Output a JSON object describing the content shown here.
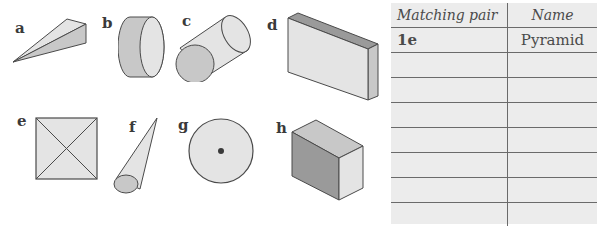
{
  "shapes": [
    {
      "label": "a",
      "depicts": "triangular prism (wedge/pyramid-like)"
    },
    {
      "label": "b",
      "depicts": "cylinder (short disc)"
    },
    {
      "label": "c",
      "depicts": "cylinder (lying)"
    },
    {
      "label": "d",
      "depicts": "cuboid"
    },
    {
      "label": "e",
      "depicts": "square-based pyramid (top view)"
    },
    {
      "label": "f",
      "depicts": "cone"
    },
    {
      "label": "g",
      "depicts": "cone (top view)"
    },
    {
      "label": "h",
      "depicts": "cuboid (cube)"
    }
  ],
  "table": {
    "headers": [
      "Matching pair",
      "Name"
    ],
    "rows": [
      [
        "1e",
        "Pyramid"
      ],
      [
        "",
        ""
      ],
      [
        "",
        ""
      ],
      [
        "",
        ""
      ],
      [
        "",
        ""
      ],
      [
        "",
        ""
      ],
      [
        "",
        ""
      ],
      [
        "",
        ""
      ]
    ]
  },
  "colors": {
    "shape_light": "#e4e4e4",
    "shape_mid": "#c8c8c8",
    "shape_dark": "#9a9a9a",
    "stroke": "#4a4a4a",
    "table_bg": "#ececec"
  }
}
